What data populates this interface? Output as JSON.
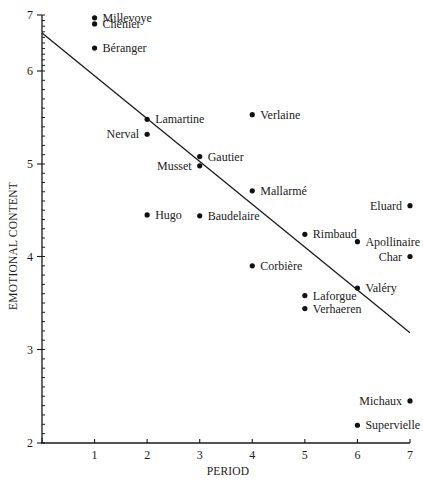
{
  "chart_data": {
    "type": "scatter",
    "title": "",
    "xlabel": "PERIOD",
    "ylabel": "EMOTIONAL CONTENT",
    "xlim": [
      0,
      7
    ],
    "ylim": [
      2,
      7
    ],
    "x_ticks": [
      1,
      2,
      3,
      4,
      5,
      6,
      7
    ],
    "y_ticks": [
      2,
      3,
      4,
      5,
      6,
      7
    ],
    "grid": false,
    "legend": "none",
    "points": [
      {
        "label": "Millevoye",
        "x": 1,
        "y": 6.95,
        "label_side": "right"
      },
      {
        "label": "Chénier",
        "x": 1,
        "y": 6.84,
        "label_side": "right"
      },
      {
        "label": "Béranger",
        "x": 1,
        "y": 6.41,
        "label_side": "right"
      },
      {
        "label": "Lamartine",
        "x": 2,
        "y": 5.48,
        "label_side": "right"
      },
      {
        "label": "Nerval",
        "x": 2,
        "y": 5.32,
        "label_side": "left"
      },
      {
        "label": "Hugo",
        "x": 2,
        "y": 4.45,
        "label_side": "right"
      },
      {
        "label": "Gautier",
        "x": 3,
        "y": 5.08,
        "label_side": "right"
      },
      {
        "label": "Musset",
        "x": 3,
        "y": 4.98,
        "label_side": "left"
      },
      {
        "label": "Baudelaire",
        "x": 3,
        "y": 4.44,
        "label_side": "right"
      },
      {
        "label": "Verlaine",
        "x": 4,
        "y": 5.53,
        "label_side": "right"
      },
      {
        "label": "Mallarmé",
        "x": 4,
        "y": 4.71,
        "label_side": "right"
      },
      {
        "label": "Corbière",
        "x": 4,
        "y": 3.9,
        "label_side": "right"
      },
      {
        "label": "Rimbaud",
        "x": 5,
        "y": 4.24,
        "label_side": "right"
      },
      {
        "label": "Laforgue",
        "x": 5,
        "y": 3.58,
        "label_side": "right"
      },
      {
        "label": "Verhaeren",
        "x": 5,
        "y": 3.44,
        "label_side": "right"
      },
      {
        "label": "Apollinaire",
        "x": 6,
        "y": 4.16,
        "label_side": "right"
      },
      {
        "label": "Valéry",
        "x": 6,
        "y": 3.66,
        "label_side": "right"
      },
      {
        "label": "Supervielle",
        "x": 6,
        "y": 2.19,
        "label_side": "right"
      },
      {
        "label": "Eluard",
        "x": 7,
        "y": 4.55,
        "label_side": "left"
      },
      {
        "label": "Char",
        "x": 7,
        "y": 4.0,
        "label_side": "left"
      },
      {
        "label": "Michaux",
        "x": 7,
        "y": 2.45,
        "label_side": "left"
      }
    ],
    "regression_line": {
      "x0": 0,
      "y0": 6.68,
      "x1": 7,
      "y1": 3.18
    },
    "colors": {
      "ink": "#111111",
      "background": "#ffffff"
    }
  }
}
